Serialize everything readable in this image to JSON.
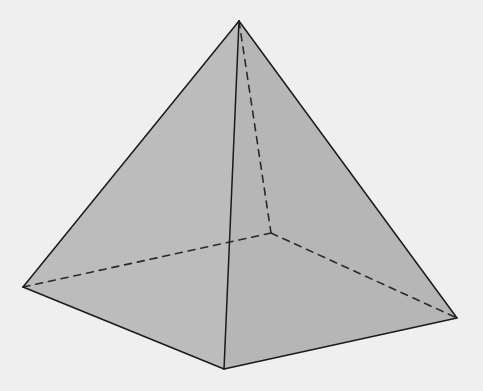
{
  "diagram": {
    "background_color": "#efefef",
    "face_color": "#b9b9b9",
    "face_color_left": "#bcbcbc",
    "face_color_right": "#b6b6b6",
    "edge_color": "#1a1a1a",
    "hidden_edge_color": "#2a2a2a",
    "vertices": {
      "apex": [
        239,
        21
      ],
      "base_left": [
        23,
        287
      ],
      "base_front": [
        224,
        369
      ],
      "base_right": [
        457,
        318
      ],
      "base_back_hidden": [
        271,
        233
      ]
    },
    "visible_edges": [
      [
        "apex",
        "base_left"
      ],
      [
        "apex",
        "base_front"
      ],
      [
        "apex",
        "base_right"
      ],
      [
        "base_left",
        "base_front"
      ],
      [
        "base_front",
        "base_right"
      ]
    ],
    "hidden_edges": [
      [
        "apex",
        "base_back_hidden"
      ],
      [
        "base_left",
        "base_back_hidden"
      ],
      [
        "base_back_hidden",
        "base_right"
      ]
    ]
  }
}
